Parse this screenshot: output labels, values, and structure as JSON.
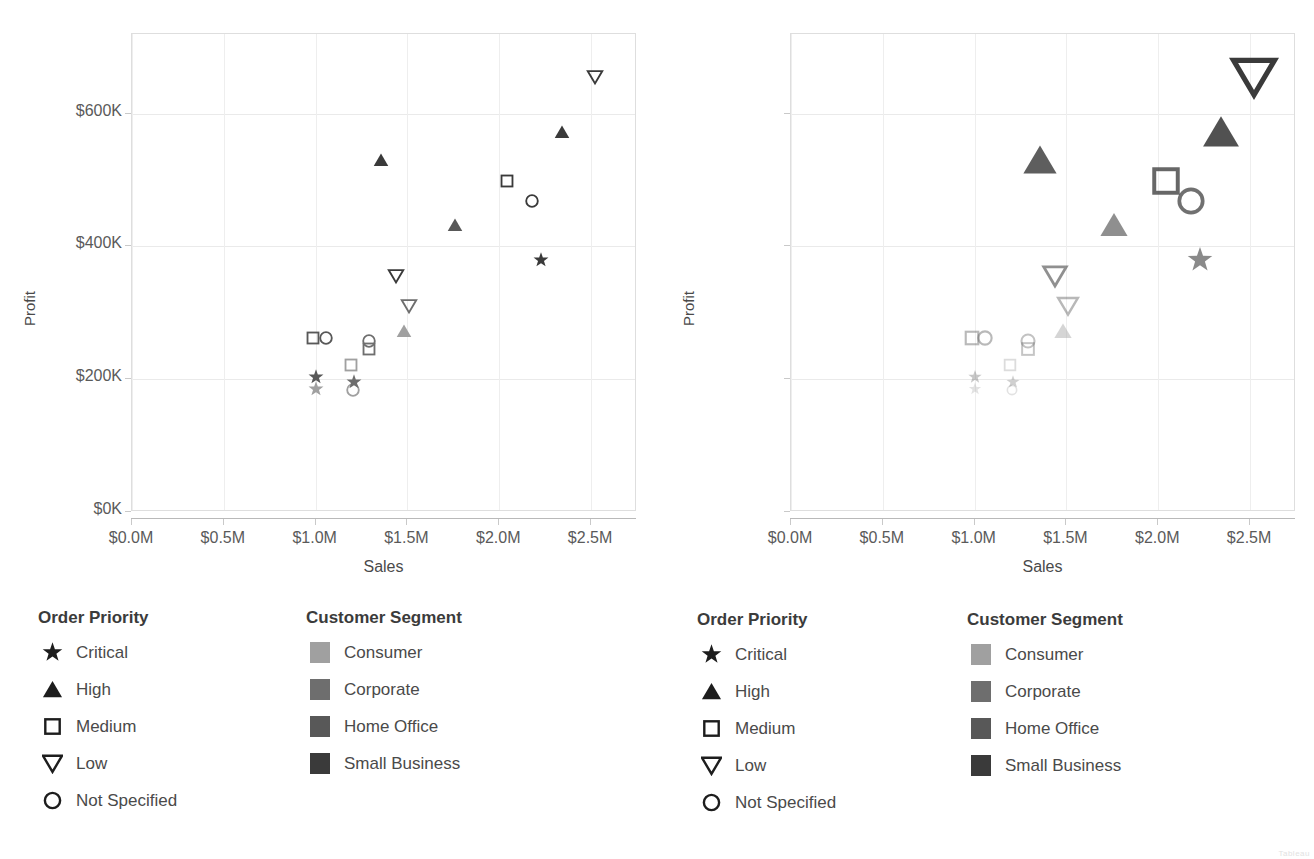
{
  "axes": {
    "x_title": "Sales",
    "y_title": "Profit",
    "x_ticks": [
      "$0.0M",
      "$0.5M",
      "$1.0M",
      "$1.5M",
      "$2.0M",
      "$2.5M"
    ],
    "y_ticks": [
      "$0K",
      "$200K",
      "$400K",
      "$600K"
    ]
  },
  "legends": {
    "order_priority": {
      "title": "Order Priority",
      "items": [
        {
          "label": "Critical",
          "shape": "star-icon"
        },
        {
          "label": "High",
          "shape": "triangle-up-icon"
        },
        {
          "label": "Medium",
          "shape": "square-outline-icon"
        },
        {
          "label": "Low",
          "shape": "triangle-down-icon"
        },
        {
          "label": "Not Specified",
          "shape": "circle-outline-icon"
        }
      ]
    },
    "customer_segment": {
      "title": "Customer Segment",
      "items": [
        {
          "label": "Consumer",
          "color": "#a0a0a0"
        },
        {
          "label": "Corporate",
          "color": "#6e6e6e"
        },
        {
          "label": "Home Office",
          "color": "#585858"
        },
        {
          "label": "Small Business",
          "color": "#3a3a3a"
        }
      ]
    }
  },
  "corner_note": "Tableau",
  "chart_data": [
    {
      "id": "left",
      "type": "scatter",
      "title": "",
      "xlabel": "Sales",
      "ylabel": "Profit",
      "xlim": [
        0,
        2750000
      ],
      "ylim": [
        0,
        720000
      ],
      "xtick_values": [
        0,
        500000,
        1000000,
        1500000,
        2000000,
        2500000
      ],
      "ytick_values": [
        0,
        200000,
        400000,
        600000
      ],
      "grid": true,
      "legend_position": "below",
      "size_encoding": false,
      "shape_field": "Order Priority",
      "color_field": "Customer Segment",
      "points": [
        {
          "sales": 2520000,
          "profit": 655000,
          "priority": "Low",
          "segment": "Small Business"
        },
        {
          "sales": 2340000,
          "profit": 573000,
          "priority": "High",
          "segment": "Small Business"
        },
        {
          "sales": 1355000,
          "profit": 530000,
          "priority": "High",
          "segment": "Small Business"
        },
        {
          "sales": 2040000,
          "profit": 498000,
          "priority": "Medium",
          "segment": "Small Business"
        },
        {
          "sales": 2180000,
          "profit": 468000,
          "priority": "Not Specified",
          "segment": "Small Business"
        },
        {
          "sales": 1760000,
          "profit": 432000,
          "priority": "High",
          "segment": "Home Office"
        },
        {
          "sales": 2225000,
          "profit": 380000,
          "priority": "Critical",
          "segment": "Small Business"
        },
        {
          "sales": 1440000,
          "profit": 356000,
          "priority": "Low",
          "segment": "Small Business"
        },
        {
          "sales": 1510000,
          "profit": 310000,
          "priority": "Low",
          "segment": "Corporate"
        },
        {
          "sales": 1480000,
          "profit": 272000,
          "priority": "High",
          "segment": "Consumer"
        },
        {
          "sales": 985000,
          "profit": 262000,
          "priority": "Medium",
          "segment": "Home Office"
        },
        {
          "sales": 1055000,
          "profit": 262000,
          "priority": "Not Specified",
          "segment": "Home Office"
        },
        {
          "sales": 1290000,
          "profit": 258000,
          "priority": "Not Specified",
          "segment": "Corporate"
        },
        {
          "sales": 1290000,
          "profit": 245000,
          "priority": "Medium",
          "segment": "Corporate"
        },
        {
          "sales": 1195000,
          "profit": 222000,
          "priority": "Medium",
          "segment": "Consumer"
        },
        {
          "sales": 1000000,
          "profit": 203000,
          "priority": "Critical",
          "segment": "Home Office"
        },
        {
          "sales": 1210000,
          "profit": 196000,
          "priority": "Critical",
          "segment": "Corporate"
        },
        {
          "sales": 1000000,
          "profit": 186000,
          "priority": "Critical",
          "segment": "Consumer"
        },
        {
          "sales": 1205000,
          "profit": 184000,
          "priority": "Not Specified",
          "segment": "Consumer"
        }
      ]
    },
    {
      "id": "right",
      "type": "scatter",
      "title": "",
      "xlabel": "Sales",
      "ylabel": "Profit",
      "xlim": [
        0,
        2750000
      ],
      "ylim": [
        0,
        720000
      ],
      "xtick_values": [
        0,
        500000,
        1000000,
        1500000,
        2000000,
        2500000
      ],
      "ytick_values": [
        0,
        200000,
        400000,
        600000
      ],
      "grid": true,
      "legend_position": "below",
      "size_encoding": true,
      "shape_field": "Order Priority",
      "color_field": "Customer Segment",
      "points": [
        {
          "sales": 2520000,
          "profit": 655000,
          "priority": "Low",
          "segment": "Small Business"
        },
        {
          "sales": 2340000,
          "profit": 573000,
          "priority": "High",
          "segment": "Small Business"
        },
        {
          "sales": 1355000,
          "profit": 530000,
          "priority": "High",
          "segment": "Small Business"
        },
        {
          "sales": 2040000,
          "profit": 498000,
          "priority": "Medium",
          "segment": "Small Business"
        },
        {
          "sales": 2180000,
          "profit": 468000,
          "priority": "Not Specified",
          "segment": "Small Business"
        },
        {
          "sales": 1760000,
          "profit": 432000,
          "priority": "High",
          "segment": "Home Office"
        },
        {
          "sales": 2225000,
          "profit": 380000,
          "priority": "Critical",
          "segment": "Small Business"
        },
        {
          "sales": 1440000,
          "profit": 356000,
          "priority": "Low",
          "segment": "Small Business"
        },
        {
          "sales": 1510000,
          "profit": 310000,
          "priority": "Low",
          "segment": "Corporate"
        },
        {
          "sales": 1480000,
          "profit": 272000,
          "priority": "High",
          "segment": "Consumer"
        },
        {
          "sales": 985000,
          "profit": 262000,
          "priority": "Medium",
          "segment": "Home Office"
        },
        {
          "sales": 1055000,
          "profit": 262000,
          "priority": "Not Specified",
          "segment": "Home Office"
        },
        {
          "sales": 1290000,
          "profit": 258000,
          "priority": "Not Specified",
          "segment": "Corporate"
        },
        {
          "sales": 1290000,
          "profit": 245000,
          "priority": "Medium",
          "segment": "Corporate"
        },
        {
          "sales": 1195000,
          "profit": 222000,
          "priority": "Medium",
          "segment": "Consumer"
        },
        {
          "sales": 1000000,
          "profit": 203000,
          "priority": "Critical",
          "segment": "Home Office"
        },
        {
          "sales": 1210000,
          "profit": 196000,
          "priority": "Critical",
          "segment": "Corporate"
        },
        {
          "sales": 1000000,
          "profit": 186000,
          "priority": "Critical",
          "segment": "Consumer"
        },
        {
          "sales": 1205000,
          "profit": 184000,
          "priority": "Not Specified",
          "segment": "Consumer"
        }
      ]
    }
  ]
}
